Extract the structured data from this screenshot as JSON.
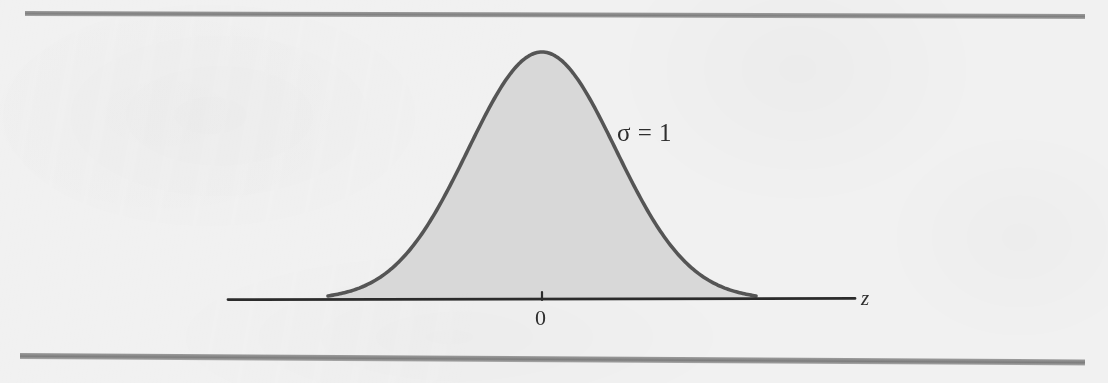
{
  "figure": {
    "kind": "normal-distribution-curve",
    "background_color": "#f1f1f1",
    "rule_color": "#8e8e8e",
    "labels": {
      "sigma": "σ = 1",
      "mean_tick": "0",
      "axis_variable": "z"
    }
  },
  "chart_data": {
    "type": "line",
    "title": "",
    "subtitle": "",
    "xlabel": "z",
    "ylabel": "",
    "grid": false,
    "legend": null,
    "annotations": [
      {
        "text": "σ = 1",
        "x": 1.0,
        "y": 0.46,
        "name": "sigma-annotation"
      },
      {
        "text": "0",
        "x": 0.0,
        "y": -0.07,
        "name": "mean-tick-label"
      },
      {
        "text": "z",
        "x": 4.2,
        "y": -0.02,
        "name": "axis-variable-label"
      }
    ],
    "distribution": {
      "name": "standard normal",
      "mu": 0,
      "sigma": 1,
      "shaded": true,
      "fill_color": "#d6d6d6",
      "stroke_color": "#555555"
    },
    "xlim": [
      -4.2,
      4.4
    ],
    "ylim": [
      0,
      1.06
    ],
    "x": [
      -2.9,
      -2.7,
      -2.5,
      -2.3,
      -2.1,
      -1.9,
      -1.7,
      -1.5,
      -1.3,
      -1.1,
      -0.9,
      -0.7,
      -0.5,
      -0.3,
      -0.1,
      0.0,
      0.1,
      0.3,
      0.5,
      0.7,
      0.9,
      1.1,
      1.3,
      1.5,
      1.7,
      1.9,
      2.1,
      2.3,
      2.5,
      2.7,
      2.9
    ],
    "y": [
      0.015,
      0.026,
      0.044,
      0.071,
      0.11,
      0.164,
      0.235,
      0.325,
      0.43,
      0.546,
      0.667,
      0.783,
      0.882,
      0.956,
      0.995,
      1.0,
      0.995,
      0.956,
      0.882,
      0.783,
      0.667,
      0.546,
      0.43,
      0.325,
      0.235,
      0.164,
      0.11,
      0.071,
      0.044,
      0.026,
      0.015
    ],
    "xticks": [
      0
    ],
    "xticklabels": [
      "0"
    ],
    "yticks": [],
    "yticklabels": []
  }
}
